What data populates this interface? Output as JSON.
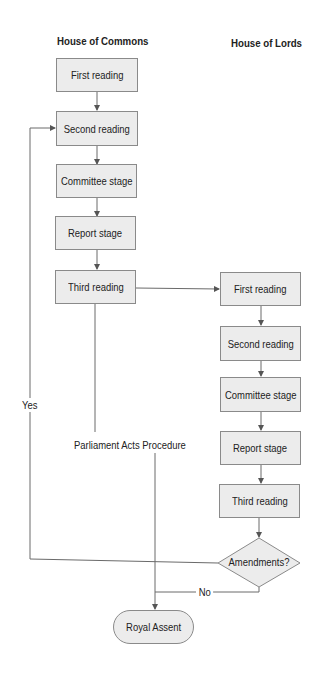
{
  "diagram": {
    "title": "Parliament Acts Procedure",
    "columns": {
      "commons": "House of Commons",
      "lords": "House of Lords"
    },
    "commons_stages": [
      {
        "label": "First reading"
      },
      {
        "label": "Second reading"
      },
      {
        "label": "Committee stage"
      },
      {
        "label": "Report stage"
      },
      {
        "label": "Third reading"
      }
    ],
    "lords_stages": [
      {
        "label": "First reading"
      },
      {
        "label": "Second reading"
      },
      {
        "label": "Committee stage"
      },
      {
        "label": "Report stage"
      },
      {
        "label": "Third reading"
      }
    ],
    "decision": {
      "label": "Amendments?",
      "yes_label": "Yes",
      "no_label": "No"
    },
    "terminal": {
      "label": "Royal Assent"
    },
    "colors": {
      "box_fill": "#ececec",
      "box_border": "#8a8a8a",
      "line": "#6a6a6a",
      "text": "#222222"
    }
  }
}
